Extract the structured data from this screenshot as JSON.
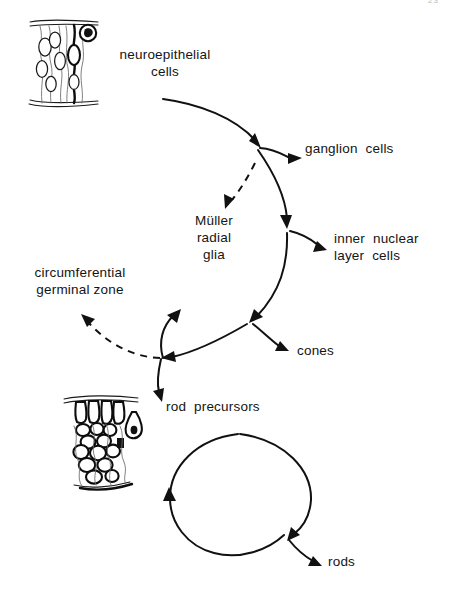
{
  "page": {
    "page_number": "23",
    "background_color": "#ffffff",
    "ink_color": "#111111"
  },
  "diagram": {
    "type": "lineage-flow-diagram",
    "nodes": [
      {
        "id": "neuroepithelial",
        "label": "neuroepithelial\ncells",
        "x": 165,
        "y": 48,
        "align": "center"
      },
      {
        "id": "ganglion",
        "label": "ganglion  cells",
        "x": 305,
        "y": 148,
        "align": "left"
      },
      {
        "id": "muller",
        "label": "Müller\nradial\nglia",
        "x": 183,
        "y": 216,
        "align": "center"
      },
      {
        "id": "inner-nuclear",
        "label": "inner  nuclear\nlayer  cells",
        "x": 334,
        "y": 235,
        "align": "left"
      },
      {
        "id": "cgz",
        "label": "circumferential\ngerminal zone",
        "x": 15,
        "y": 268,
        "align": "center"
      },
      {
        "id": "cones",
        "label": "cones",
        "x": 297,
        "y": 346,
        "align": "left"
      },
      {
        "id": "rod-precursors",
        "label": "rod  precursors",
        "x": 166,
        "y": 400,
        "align": "left"
      },
      {
        "id": "rods",
        "label": "rods",
        "x": 328,
        "y": 557,
        "align": "left"
      }
    ],
    "edges": [
      {
        "from": "neuroepithelial",
        "to": "junction-upper",
        "style": "solid",
        "arrow": true
      },
      {
        "from": "junction-upper",
        "to": "ganglion",
        "style": "solid",
        "arrow": true
      },
      {
        "from": "junction-upper",
        "to": "muller",
        "style": "dashed",
        "arrow": true
      },
      {
        "from": "junction-upper",
        "to": "junction-middle",
        "style": "solid",
        "arrow": true
      },
      {
        "from": "junction-middle",
        "to": "inner-nuclear",
        "style": "solid",
        "arrow": true
      },
      {
        "from": "junction-middle",
        "to": "junction-lower",
        "style": "solid",
        "arrow": true
      },
      {
        "from": "junction-lower",
        "to": "cones",
        "style": "solid",
        "arrow": true
      },
      {
        "from": "junction-lower",
        "to": "junction-left",
        "style": "solid",
        "arrow": true
      },
      {
        "from": "junction-left",
        "to": "cgz",
        "style": "dashed",
        "arrow": true
      },
      {
        "from": "junction-left",
        "to": "muller",
        "style": "solid",
        "arrow": true
      },
      {
        "from": "junction-left",
        "to": "rod-precursors",
        "style": "solid",
        "arrow": true
      },
      {
        "from": "rod-precursors",
        "to": "rod-cycle",
        "style": "solid",
        "arrow": true
      },
      {
        "from": "rod-cycle",
        "to": "rods",
        "style": "solid",
        "arrow": true
      }
    ],
    "illustrations": [
      {
        "id": "neuroepithelium-drawing",
        "name": "neuroepithelium-micrograph-sketch",
        "x": 28,
        "y": 16,
        "w": 72,
        "h": 90
      },
      {
        "id": "rod-precursor-drawing",
        "name": "rod-precursor-micrograph-sketch",
        "x": 62,
        "y": 386,
        "w": 78,
        "h": 108
      }
    ]
  }
}
